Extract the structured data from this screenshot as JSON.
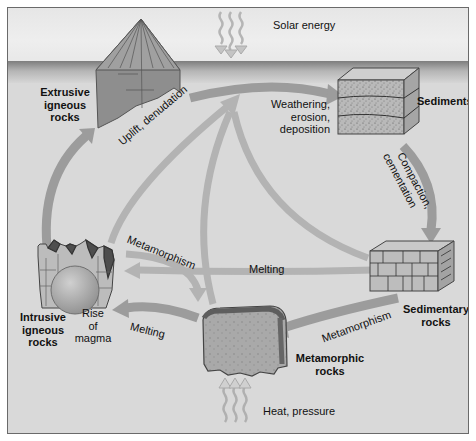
{
  "diagram": {
    "style": "grayscale",
    "colors": {
      "background": "#d9d9d9",
      "sky": "#ececec",
      "arrow": "#9a9a9a",
      "border": "#6a6a6a",
      "text": "#111111"
    },
    "energy_sources": {
      "top": "Solar energy",
      "bottom": "Heat, pressure"
    },
    "nodes": {
      "extrusive": {
        "line1": "Extrusive",
        "line2": "igneous",
        "line3": "rocks"
      },
      "sediments": {
        "label": "Sediments"
      },
      "sedimentary": {
        "line1": "Sedimentary",
        "line2": "rocks"
      },
      "metamorphic": {
        "line1": "Metamorphic",
        "line2": "rocks"
      },
      "intrusive": {
        "line1": "Intrusive",
        "line2": "igneous",
        "line3": "rocks"
      },
      "magma": {
        "line1": "Rise",
        "line2": "of",
        "line3": "magma"
      }
    },
    "processes": {
      "uplift": "Uplift, denudation",
      "weathering": {
        "line1": "Weathering,",
        "line2": "erosion,",
        "line3": "deposition"
      },
      "compaction": {
        "line1": "Compaction,",
        "line2": "cementation"
      },
      "metamorphism_upper": "Metamorphism",
      "melting_upper": "Melting",
      "metamorphism_lower": "Metamorphism",
      "melting_lower": "Melting"
    },
    "edges": [
      {
        "from": "Extrusive igneous rocks",
        "to": "Sediments",
        "label": "Weathering, erosion, deposition"
      },
      {
        "from": "Sediments",
        "to": "Sedimentary rocks",
        "label": "Compaction, cementation"
      },
      {
        "from": "Sedimentary rocks",
        "to": "Metamorphic rocks",
        "label": "Metamorphism"
      },
      {
        "from": "Sedimentary rocks",
        "to": "Intrusive igneous rocks",
        "label": "Melting"
      },
      {
        "from": "Metamorphic rocks",
        "to": "Intrusive igneous rocks",
        "label": "Melting"
      },
      {
        "from": "Intrusive igneous rocks",
        "to": "Metamorphic rocks",
        "label": "Metamorphism"
      },
      {
        "from": "Intrusive igneous rocks",
        "to": "Extrusive igneous rocks",
        "label": "Rise of magma"
      },
      {
        "from": "Intrusive igneous rocks",
        "to": "Surface",
        "label": "Uplift, denudation"
      },
      {
        "from": "Metamorphic rocks",
        "to": "Surface",
        "label": "Uplift, denudation"
      },
      {
        "from": "Sedimentary rocks",
        "to": "Surface",
        "label": "Uplift, denudation"
      }
    ]
  }
}
